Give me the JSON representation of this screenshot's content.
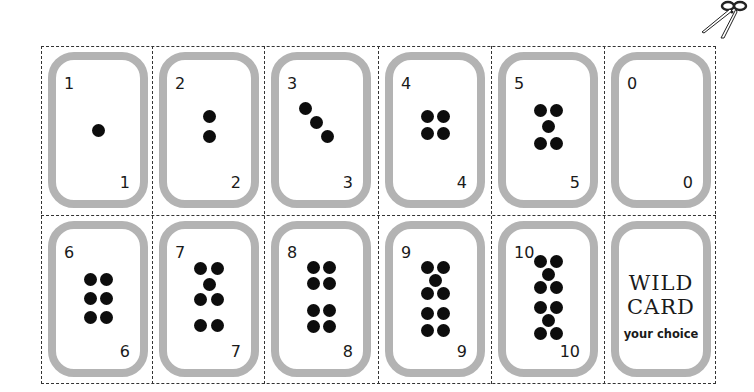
{
  "sheet": {
    "colors": {
      "card_border": "#b3b3b3",
      "pip": "#0d0d0d",
      "cut_line": "#333333"
    },
    "cards": [
      {
        "top_label": "1",
        "bottom_label": "1",
        "value": 1
      },
      {
        "top_label": "2",
        "bottom_label": "2",
        "value": 2
      },
      {
        "top_label": "3",
        "bottom_label": "3",
        "value": 3
      },
      {
        "top_label": "4",
        "bottom_label": "4",
        "value": 4
      },
      {
        "top_label": "5",
        "bottom_label": "5",
        "value": 5
      },
      {
        "top_label": "0",
        "bottom_label": "0",
        "value": 0
      },
      {
        "top_label": "6",
        "bottom_label": "6",
        "value": 6
      },
      {
        "top_label": "7",
        "bottom_label": "7",
        "value": 7
      },
      {
        "top_label": "8",
        "bottom_label": "8",
        "value": 8
      },
      {
        "top_label": "9",
        "bottom_label": "9",
        "value": 9
      },
      {
        "top_label": "10",
        "bottom_label": "10",
        "value": 10
      }
    ],
    "wild_card": {
      "line1": "WILD",
      "line2": "CARD",
      "line3": "your choice"
    },
    "scissors_icon": "scissors-icon"
  }
}
